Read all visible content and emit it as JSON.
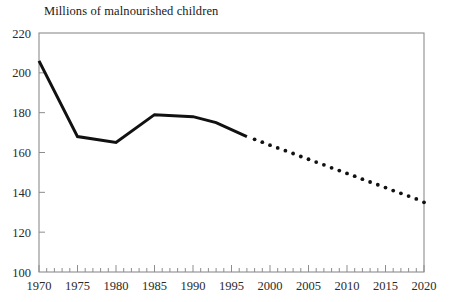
{
  "chart_data": {
    "type": "line",
    "title": "Millions of malnourished children",
    "xlabel": "",
    "ylabel": "",
    "xlim": [
      1970,
      2020
    ],
    "ylim": [
      100,
      220
    ],
    "grid": false,
    "legend": "none",
    "y_ticks": [
      100,
      120,
      140,
      160,
      180,
      200,
      220
    ],
    "x_ticks": [
      1970,
      1975,
      1980,
      1985,
      1990,
      1995,
      2000,
      2005,
      2010,
      2015,
      2020
    ],
    "x_minor_tick_step": 1,
    "y_tick_labels": [
      "100",
      "120",
      "140",
      "160",
      "180",
      "200",
      "220"
    ],
    "x_tick_labels": [
      "1970",
      "1975",
      "1980",
      "1985",
      "1990",
      "1995",
      "2000",
      "2005",
      "2010",
      "2015",
      "2020"
    ],
    "series": [
      {
        "name": "Observed (solid line)",
        "style": "solid",
        "color": "#111111",
        "x": [
          1970,
          1975,
          1980,
          1985,
          1990,
          1993,
          1997
        ],
        "values": [
          206,
          168,
          165,
          179,
          178,
          175,
          168
        ]
      },
      {
        "name": "Projected (dotted line)",
        "style": "dotted",
        "color": "#111111",
        "x": [
          1997,
          1998,
          1999,
          2000,
          2001,
          2002,
          2003,
          2004,
          2005,
          2006,
          2007,
          2008,
          2009,
          2010,
          2011,
          2012,
          2013,
          2014,
          2015,
          2016,
          2017,
          2018,
          2019,
          2020
        ],
        "values": [
          168,
          166.6,
          165.2,
          163.7,
          162.3,
          160.9,
          159.5,
          158.0,
          156.6,
          155.2,
          153.8,
          152.3,
          150.9,
          149.5,
          148.1,
          146.6,
          145.2,
          143.8,
          142.4,
          140.9,
          139.5,
          138.1,
          136.7,
          135
        ]
      }
    ]
  }
}
